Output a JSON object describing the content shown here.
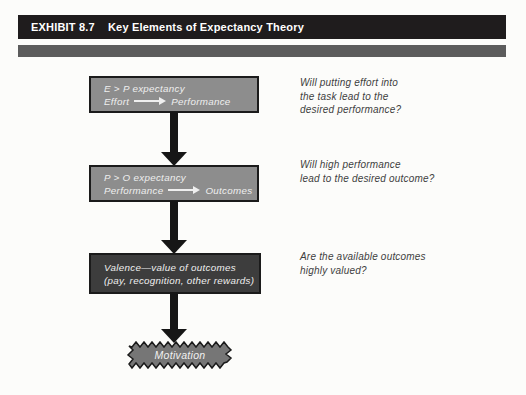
{
  "colors": {
    "page_bg": "#fcfcfa",
    "bar_black": "#1f1c1d",
    "bar_gray": "#5c5c5c",
    "box_gray": "#8d8d8d",
    "box_dark": "#3d3d3d",
    "burst_gray": "#767676",
    "box_border": "#1b1b1b",
    "arrow_black": "#161616",
    "box_text": "#efefef",
    "question_text": "#3e3e3e"
  },
  "header": {
    "exhibit_label": "EXHIBIT 8.7",
    "title": "Key Elements of Expectancy Theory"
  },
  "flow": {
    "steps": [
      {
        "title": "E > P expectancy",
        "flow_from": "Effort",
        "flow_to": "Performance",
        "question_lines": [
          "Will putting effort into",
          "the task lead to the",
          "desired performance?"
        ]
      },
      {
        "title": "P > O expectancy",
        "flow_from": "Performance",
        "flow_to": "Outcomes",
        "question_lines": [
          "Will high performance",
          "lead to the desired outcome?"
        ]
      },
      {
        "title": "Valence—value of outcomes",
        "subtitle": "(pay, recognition, other rewards)",
        "question_lines": [
          "Are the available outcomes",
          "highly valued?"
        ]
      }
    ],
    "result_label": "Motivation"
  }
}
